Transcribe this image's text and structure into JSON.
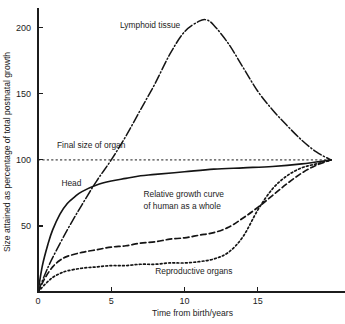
{
  "chart_data": {
    "type": "line",
    "title": "",
    "xlabel": "Time from birth/years",
    "ylabel": "Size attained as percentage of total postnatal growth",
    "xlim": [
      0,
      20
    ],
    "ylim": [
      0,
      215
    ],
    "xticks": [
      0,
      5,
      10,
      15
    ],
    "xtick_labels": [
      "0",
      "5",
      "10",
      "15"
    ],
    "yticks": [
      50,
      100,
      150,
      200
    ],
    "ytick_labels": [
      "50",
      "100",
      "150",
      "200"
    ],
    "grid": false,
    "legend_position": "inline-annotations",
    "reference_lines": [
      {
        "name": "final-size-of-organ",
        "label": "Final size of organ",
        "y": 100,
        "style": "dashed"
      }
    ],
    "annotations": [
      {
        "name": "lymphoid-tissue-label",
        "text": "Lymphoid tissue",
        "x": 5.6,
        "y": 200
      },
      {
        "name": "final-size-of-organ-label",
        "text": "Final size of organ",
        "x": 1.3,
        "y": 109
      },
      {
        "name": "head-label",
        "text": "Head",
        "x": 1.6,
        "y": 80
      },
      {
        "name": "human-whole-label-line1",
        "text": "Relative growth curve",
        "x": 7.2,
        "y": 72
      },
      {
        "name": "human-whole-label-line2",
        "text": "of human as a whole",
        "x": 7.2,
        "y": 63
      },
      {
        "name": "reproductive-organs-label",
        "text": "Reproductive organs",
        "x": 8.0,
        "y": 14
      }
    ],
    "series": [
      {
        "name": "Lymphoid tissue",
        "style": "dash-dot",
        "x": [
          0,
          0.5,
          1,
          2,
          3,
          4,
          5,
          6,
          7,
          8,
          9,
          10,
          11,
          11.5,
          12,
          13,
          14,
          15,
          16,
          17,
          18,
          19,
          20
        ],
        "values": [
          0,
          14,
          26,
          47,
          66,
          84,
          100,
          118,
          138,
          158,
          180,
          197,
          205,
          206,
          202,
          188,
          170,
          152,
          138,
          126,
          115,
          106,
          100
        ]
      },
      {
        "name": "Head",
        "style": "solid",
        "x": [
          0,
          0.3,
          0.7,
          1,
          1.5,
          2,
          2.5,
          3,
          4,
          5,
          6,
          7,
          8,
          10,
          12,
          14,
          16,
          18,
          20
        ],
        "values": [
          0,
          20,
          37,
          47,
          59,
          67,
          72,
          76,
          81,
          84,
          86,
          88,
          89,
          91,
          93,
          94,
          95,
          97,
          100
        ]
      },
      {
        "name": "Relative growth curve of human as a whole",
        "style": "dashed",
        "x": [
          0,
          0.5,
          1,
          1.5,
          2,
          3,
          4,
          5,
          6,
          7,
          8,
          9,
          10,
          11,
          12,
          13,
          14,
          15,
          16,
          17,
          18,
          19,
          20
        ],
        "values": [
          0,
          11,
          19,
          24,
          27,
          30,
          32,
          34,
          35,
          37,
          38,
          40,
          41,
          43,
          45,
          49,
          56,
          64,
          73,
          82,
          90,
          96,
          100
        ]
      },
      {
        "name": "Reproductive organs",
        "style": "dotted",
        "x": [
          0,
          0.5,
          1,
          1.5,
          2,
          3,
          4,
          5,
          6,
          7,
          8,
          9,
          10,
          11,
          12,
          13,
          14,
          15,
          16,
          17,
          18,
          19,
          20
        ],
        "values": [
          0,
          6,
          11,
          14,
          16,
          18,
          19,
          20,
          20,
          21,
          21,
          22,
          22,
          23,
          25,
          30,
          42,
          62,
          78,
          88,
          94,
          97,
          100
        ]
      }
    ]
  }
}
